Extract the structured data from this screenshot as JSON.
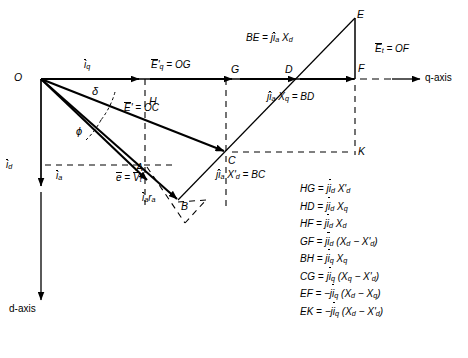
{
  "figure": {
    "kind": "synchronous-machine-two-axis-phasor-diagram",
    "axes": {
      "q_axis_label": "q-axis",
      "d_axis_label": "d-axis"
    },
    "points": {
      "O": "O",
      "A": "A",
      "B": "B",
      "C": "C",
      "D": "D",
      "E": "E",
      "F": "F",
      "G": "G",
      "H": "H",
      "K": "K"
    },
    "angles": {
      "delta": "δ",
      "phi": "ϕ"
    },
    "vector_labels": {
      "iq": "īq",
      "id": "īd",
      "ia": "īa",
      "ia_ra": "īa r a",
      "e_vt": "ē = V̄t",
      "Eq_prime_OG": "Ē'q = OG",
      "E_prime_OC": "Ē' = OC",
      "Et_OF": "Ēt = OF",
      "BE_jia_Xd": "BE = jīa Xd",
      "jia_Xq_BD": "jīa Xq = BD",
      "jia_Xdp_BC": "jīa X'd = BC"
    },
    "equations": [
      {
        "lhs": "HG",
        "rhs": "jīd X'd"
      },
      {
        "lhs": "HD",
        "rhs": "jīd Xq"
      },
      {
        "lhs": "HF",
        "rhs": "jīd Xd"
      },
      {
        "lhs": "GF",
        "rhs": "jīd (Xd − X'd)"
      },
      {
        "lhs": "BH",
        "rhs": "jīq Xq"
      },
      {
        "lhs": "CG",
        "rhs": "jīq (Xq − X'd)"
      },
      {
        "lhs": "EF",
        "rhs": "−jīq (Xd − Xq)"
      },
      {
        "lhs": "EK",
        "rhs": "−jīq (Xd − X'd)"
      }
    ],
    "colors": {
      "stroke": "#000000",
      "background": "#ffffff"
    }
  }
}
